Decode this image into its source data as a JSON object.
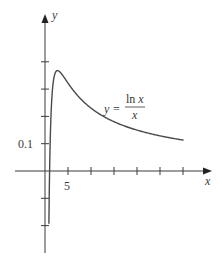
{
  "chart_data": {
    "type": "line",
    "title": "",
    "xlabel": "x",
    "ylabel": "y",
    "series": [
      {
        "name": "y = ln x / x",
        "function": "ln(x)/x",
        "x": [
          0.85,
          0.9,
          1,
          1.25,
          1.5,
          2,
          2.718,
          3,
          4,
          5,
          6,
          8,
          10,
          12,
          15,
          18,
          20,
          22,
          25,
          28,
          30
        ],
        "values": [
          -0.191,
          -0.117,
          0,
          0.179,
          0.27,
          0.347,
          0.368,
          0.366,
          0.347,
          0.322,
          0.299,
          0.26,
          0.23,
          0.207,
          0.181,
          0.161,
          0.15,
          0.141,
          0.129,
          0.119,
          0.113
        ]
      }
    ],
    "x_ticks": [
      5,
      10,
      15,
      20,
      25,
      30
    ],
    "x_tick_labels": [
      "5"
    ],
    "y_ticks": [
      -0.2,
      -0.1,
      0.1,
      0.2,
      0.3,
      0.4
    ],
    "y_tick_labels": [
      "0.1"
    ],
    "xlim": [
      -6,
      33
    ],
    "ylim": [
      -0.3,
      0.57
    ],
    "grid": false,
    "legend": null,
    "annotations": [
      {
        "text": "y = ln x / x",
        "position": "right of peak, above curve"
      }
    ]
  },
  "labels": {
    "x_axis": "x",
    "y_axis": "y",
    "y_tick": "0.1",
    "x_tick": "5",
    "eq_lhs": "y =",
    "eq_num": "ln x",
    "eq_den": "x"
  },
  "style": {
    "axis_color": "#3a3a3a",
    "curve_color": "#4a4a4a"
  }
}
